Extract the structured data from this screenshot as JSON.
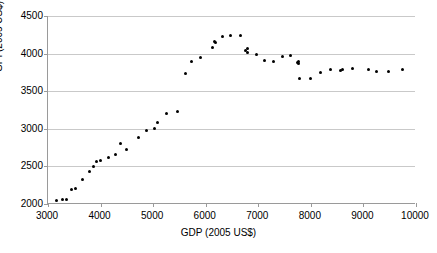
{
  "chart_data": {
    "type": "scatter",
    "title": "",
    "xlabel": "GDP (2005 US$)",
    "ylabel": "GPI (2005 US$)",
    "xlim": [
      3000,
      10000
    ],
    "ylim": [
      2000,
      4500
    ],
    "xticks": [
      3000,
      4000,
      5000,
      6000,
      7000,
      8000,
      9000,
      10000
    ],
    "yticks": [
      2000,
      2500,
      3000,
      3500,
      4000,
      4500
    ],
    "grid": "horizontal",
    "legend": "none",
    "marker": {
      "shape": "circle",
      "color": "#000000",
      "size": 3
    },
    "series": [
      {
        "name": "GPI vs GDP",
        "points": [
          [
            3160,
            2045
          ],
          [
            3270,
            2055
          ],
          [
            3350,
            2065
          ],
          [
            3440,
            2190
          ],
          [
            3520,
            2210
          ],
          [
            3650,
            2330
          ],
          [
            3780,
            2430
          ],
          [
            3860,
            2500
          ],
          [
            3930,
            2570
          ],
          [
            4000,
            2580
          ],
          [
            4160,
            2625
          ],
          [
            4280,
            2655
          ],
          [
            4370,
            2810
          ],
          [
            4490,
            2725
          ],
          [
            4720,
            2885
          ],
          [
            4870,
            2980
          ],
          [
            5020,
            3010
          ],
          [
            5090,
            3085
          ],
          [
            5260,
            3200
          ],
          [
            5460,
            3225
          ],
          [
            5620,
            3730
          ],
          [
            5730,
            3890
          ],
          [
            5900,
            3945
          ],
          [
            6120,
            4080
          ],
          [
            6160,
            4155
          ],
          [
            6180,
            4150
          ],
          [
            6320,
            4225
          ],
          [
            6480,
            4245
          ],
          [
            6660,
            4235
          ],
          [
            6760,
            4040
          ],
          [
            6790,
            4070
          ],
          [
            6800,
            4020
          ],
          [
            6960,
            3990
          ],
          [
            7110,
            3910
          ],
          [
            7290,
            3900
          ],
          [
            7470,
            3960
          ],
          [
            7610,
            3970
          ],
          [
            7740,
            3885
          ],
          [
            7760,
            3900
          ],
          [
            7770,
            3870
          ],
          [
            7790,
            3675
          ],
          [
            8000,
            3665
          ],
          [
            8190,
            3755
          ],
          [
            8370,
            3785
          ],
          [
            8560,
            3780
          ],
          [
            8610,
            3790
          ],
          [
            8800,
            3805
          ],
          [
            9090,
            3785
          ],
          [
            9250,
            3760
          ],
          [
            9470,
            3760
          ],
          [
            9750,
            3785
          ]
        ]
      }
    ]
  },
  "axes": {
    "y_tick_labels": [
      "4500",
      "4000",
      "3500",
      "3000",
      "2500",
      "2000"
    ],
    "x_tick_labels": [
      "3000",
      "4000",
      "5000",
      "6000",
      "7000",
      "8000",
      "9000",
      "10000"
    ],
    "y_title": "GPI (2005 US$)",
    "x_title": "GDP (2005 US$)"
  },
  "title": {
    "clipped_text": ""
  }
}
